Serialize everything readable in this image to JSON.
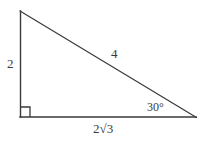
{
  "figure": {
    "type": "right-triangle-diagram",
    "background_color": "#ffffff",
    "stroke_color": "#3a3a3a",
    "text_color": "#3a3a3a",
    "vertices": {
      "top_left": [
        20,
        11
      ],
      "bottom_left": [
        20,
        117
      ],
      "bottom_right": [
        196,
        117
      ]
    },
    "right_angle_marker": {
      "at_vertex": "bottom_left",
      "size": 10
    }
  },
  "labels": {
    "leg_vertical": "2",
    "hypotenuse": "4",
    "angle": "30°",
    "leg_horizontal_coefficient": "2",
    "leg_horizontal_radical": "√",
    "leg_horizontal_radicand": "3",
    "leg_horizontal_full": "2√3"
  }
}
